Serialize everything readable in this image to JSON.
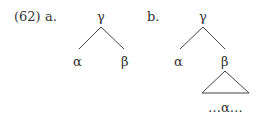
{
  "example": {
    "number": "(62)",
    "a": {
      "label": "a.",
      "root": "γ",
      "left": "α",
      "right": "β"
    },
    "b": {
      "label": "b.",
      "root": "γ",
      "left": "α",
      "right": "β",
      "subtree": "…α…"
    }
  }
}
